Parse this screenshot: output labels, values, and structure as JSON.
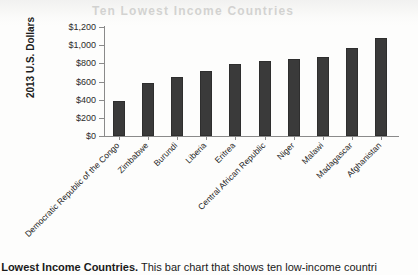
{
  "ghost": {
    "bleed_text": "Ten Lowest Income Countries"
  },
  "chart_data": {
    "type": "bar",
    "title": "",
    "xlabel": "",
    "ylabel": "2013 U.S. Dollars",
    "ylim": [
      0,
      1200
    ],
    "ytick_step": 200,
    "grid": false,
    "legend": "none",
    "bar_color": "#3a3a3a",
    "axis_color": "#8a8a8a",
    "x_label_rotation_deg": -45,
    "ytick_labels": [
      "$1,200",
      "$1,000",
      "$800",
      "$600",
      "$400",
      "$200",
      "$0"
    ],
    "ytick_values": [
      1200,
      1000,
      800,
      600,
      400,
      200,
      0
    ],
    "categories": [
      "Democratic Republic of the Congo",
      "Zimbabwe",
      "Burundi",
      "Liberia",
      "Eritrea",
      "Central African Republic",
      "Niger",
      "Malawi",
      "Madagascar",
      "Afghanistan"
    ],
    "values": [
      390,
      585,
      650,
      715,
      790,
      825,
      845,
      875,
      965,
      1080
    ]
  },
  "caption": {
    "bold_lead": "e Lowest Income Countries.",
    "rest": " This bar chart that shows ten low-income countri"
  }
}
